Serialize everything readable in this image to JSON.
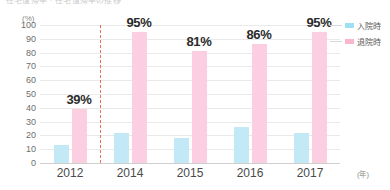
{
  "chart_data": {
    "type": "bar",
    "title": "在宅復帰率・在宅復帰率の推移",
    "subtitle": "",
    "categories": [
      "2012",
      "2014",
      "2015",
      "2016",
      "2017"
    ],
    "series": [
      {
        "name": "入院時",
        "color": "#c3e9f6",
        "values": [
          13,
          22,
          18,
          26,
          22
        ],
        "labels": [
          "",
          "",
          "",
          "",
          ""
        ]
      },
      {
        "name": "退院時",
        "color": "#fbcfe1",
        "values": [
          39,
          95,
          81,
          86,
          95
        ],
        "labels": [
          "39%",
          "95%",
          "81%",
          "86%",
          "95%"
        ]
      }
    ],
    "xlabel": "(年)",
    "ylabel": "(%)",
    "ylim": [
      0,
      100
    ],
    "yticks": [
      "100",
      "90",
      "80",
      "70",
      "60",
      "50",
      "40",
      "30",
      "20",
      "10",
      "0"
    ],
    "grid": true,
    "legend_position": "right",
    "annotations": [
      {
        "type": "vertical-dashed-line",
        "color": "#ef6b5e",
        "between": [
          "2012",
          "2014"
        ]
      }
    ]
  },
  "legend": {
    "items": [
      {
        "label": "入院時",
        "color": "#9fdff2"
      },
      {
        "label": "退院時",
        "color": "#fbb6ce"
      }
    ]
  },
  "axes": {
    "y_unit": "(%)",
    "x_unit": "(年)"
  }
}
